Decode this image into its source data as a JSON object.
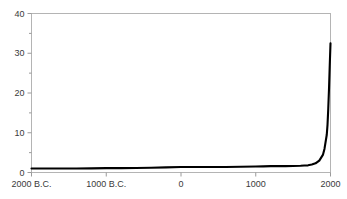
{
  "chart_data": {
    "type": "line",
    "title": "",
    "subtitle": "",
    "xlabel": "",
    "ylabel": "",
    "xlim": [
      -2000,
      2000
    ],
    "ylim": [
      0,
      40
    ],
    "grid": false,
    "legend": null,
    "annotations": [],
    "axis": {
      "y_ticks": [
        0,
        10,
        20,
        30,
        40
      ],
      "y_tick_labels": [
        "0",
        "10",
        "20",
        "30",
        "40"
      ],
      "y_minor_ticks": [
        5,
        15,
        25,
        35
      ],
      "x_ticks": [
        -2000,
        -1000,
        0,
        1000,
        2000
      ],
      "x_tick_labels": [
        "2000 B.C.",
        "1000 B.C.",
        "0",
        "1000",
        "2000"
      ]
    },
    "series": [
      {
        "name": "world-population",
        "color": "#000000",
        "x": [
          -2000,
          -1800,
          -1600,
          -1400,
          -1200,
          -1000,
          -800,
          -600,
          -400,
          -200,
          0,
          200,
          400,
          600,
          800,
          1000,
          1100,
          1200,
          1300,
          1400,
          1500,
          1600,
          1650,
          1700,
          1750,
          1800,
          1850,
          1900,
          1920,
          1950,
          1960,
          1970,
          1980,
          1990,
          2000
        ],
        "y": [
          1.0,
          1.0,
          1.0,
          1.0,
          1.05,
          1.1,
          1.1,
          1.15,
          1.2,
          1.3,
          1.4,
          1.4,
          1.4,
          1.4,
          1.45,
          1.5,
          1.55,
          1.6,
          1.6,
          1.6,
          1.65,
          1.7,
          1.75,
          1.8,
          2.0,
          2.3,
          3.0,
          4.5,
          6.0,
          9.5,
          12.0,
          16.0,
          21.0,
          27.0,
          32.5
        ]
      }
    ]
  },
  "frame": {
    "border_color": "#b4b4b4",
    "background": "#ffffff",
    "tick_color": "#9a9a9a",
    "label_color": "#3a3a3a"
  }
}
